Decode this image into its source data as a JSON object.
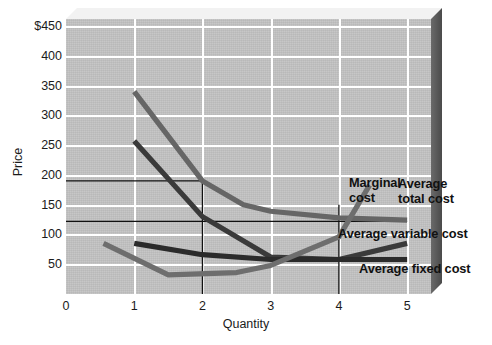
{
  "chart_data": {
    "type": "line",
    "title": "",
    "xlabel": "Quantity",
    "ylabel": "Price",
    "xlim": [
      0,
      5.35
    ],
    "ylim": [
      0,
      462
    ],
    "grid": true,
    "legend_position": "inline-right",
    "x_ticks": [
      "0",
      "1",
      "2",
      "3",
      "4",
      "5"
    ],
    "x_tick_values": [
      0,
      1,
      2,
      3,
      4,
      5
    ],
    "y_ticks": [
      "$450",
      "400",
      "350",
      "300",
      "250",
      "200",
      "150",
      "100",
      "50"
    ],
    "y_tick_values": [
      450,
      400,
      350,
      300,
      250,
      200,
      150,
      100,
      50
    ],
    "series": [
      {
        "name": "Marginal cost",
        "color": "#3a3a3a",
        "points": [
          [
            1.0,
            257
          ],
          [
            2.0,
            130
          ],
          [
            3.0,
            62
          ],
          [
            4.0,
            58
          ],
          [
            5.0,
            85
          ]
        ]
      },
      {
        "name": "Average total cost",
        "color": "#666666",
        "points": [
          [
            1.0,
            340
          ],
          [
            2.0,
            190
          ],
          [
            2.6,
            150
          ],
          [
            3.0,
            139
          ],
          [
            4.0,
            128
          ],
          [
            5.0,
            124
          ]
        ]
      },
      {
        "name": "Average variable cost",
        "color": "#2b2b2b",
        "points": [
          [
            1.0,
            85
          ],
          [
            2.0,
            66
          ],
          [
            3.0,
            58
          ],
          [
            4.0,
            58
          ],
          [
            5.0,
            58
          ]
        ]
      },
      {
        "name": "Average fixed cost",
        "color": "#6e6e6e",
        "points": [
          [
            0.55,
            85
          ],
          [
            1.5,
            32
          ],
          [
            2.5,
            36
          ],
          [
            3.0,
            48
          ],
          [
            4.0,
            96
          ],
          [
            4.45,
            183
          ]
        ]
      }
    ],
    "reference_lines": [
      {
        "type": "horizontal",
        "value": 190,
        "x_from": 0,
        "x_to": 2.0,
        "color": "#111111"
      },
      {
        "type": "horizontal",
        "value": 122,
        "x_from": 0,
        "x_to": 5.0,
        "color": "#111111"
      },
      {
        "type": "vertical",
        "value": 2.0,
        "y_from": 0,
        "y_to": 190,
        "color": "#111111"
      },
      {
        "type": "vertical",
        "value": 4.0,
        "y_from": 0,
        "y_to": 150,
        "color": "#111111"
      }
    ],
    "annotations": [
      {
        "text": "Marginal",
        "text2": "cost",
        "x": 3.45,
        "y": 220
      },
      {
        "text": "Average",
        "text2": "total cost",
        "x": 4.25,
        "y": 182
      },
      {
        "text": "Average variable cost",
        "x": 3.45,
        "y": 108
      },
      {
        "text": "Average fixed cost",
        "x": 3.75,
        "y": 48
      }
    ]
  },
  "axes": {
    "y_title": "Price",
    "x_title": "Quantity",
    "y_tick_labels": [
      "$450",
      "400",
      "350",
      "300",
      "250",
      "200",
      "150",
      "100",
      "50"
    ],
    "x_tick_labels": [
      "0",
      "1",
      "2",
      "3",
      "4",
      "5"
    ]
  },
  "labels": {
    "marginal_cost_line1": "Marginal",
    "marginal_cost_line2": "cost",
    "average_total_cost_line1": "Average",
    "average_total_cost_line2": "total cost",
    "average_variable_cost": "Average variable cost",
    "average_fixed_cost": "Average fixed cost"
  },
  "colors": {
    "plot_background": "#c3c3c3",
    "gridline": "#ffffff",
    "page_background": "#ffffff",
    "text": "#1b1b1b",
    "marginal_cost": "#3a3a3a",
    "average_total_cost": "#666666",
    "average_variable_cost": "#2b2b2b",
    "average_fixed_cost": "#6e6e6e",
    "reference_line": "#111111",
    "bevel_shadow": "#5c5c5c"
  }
}
